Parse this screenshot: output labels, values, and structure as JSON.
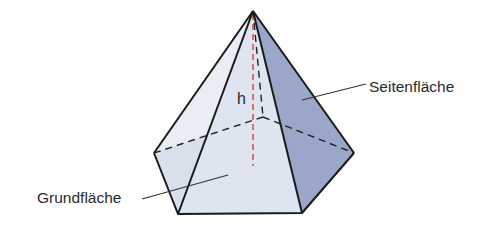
{
  "diagram": {
    "type": "pentagonal-pyramid",
    "labels": {
      "height": "h",
      "lateral_face": "Seitenfläche",
      "base": "Grundfläche"
    },
    "colors": {
      "edge": "#1a1a1a",
      "height_line": "#d9564a",
      "front_face": "#dfe5f0",
      "left_face": "#e9edf4",
      "right_face": "#9aa7c8",
      "base_visible": "#d4dcea",
      "leader": "#333333"
    }
  }
}
